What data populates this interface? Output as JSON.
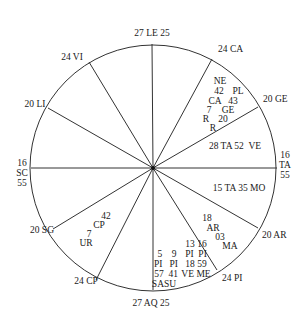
{
  "chart": {
    "center": {
      "x": 153,
      "y": 168
    },
    "radius": 123,
    "line_color": "#333333",
    "cusps": [
      {
        "label": "27 LE 25",
        "x2": 152,
        "y2": 44,
        "lx": 152,
        "ly": 36,
        "anchor": "middle"
      },
      {
        "label": "24 CA",
        "x2": 212,
        "y2": 59,
        "lx": 218,
        "ly": 52,
        "anchor": "start"
      },
      {
        "label": "20 GE",
        "x2": 258,
        "y2": 107,
        "lx": 263,
        "ly": 102,
        "anchor": "start"
      },
      {
        "label": "16",
        "x2": 277,
        "y2": 168,
        "lx": 285,
        "ly": 158,
        "anchor": "middle"
      },
      {
        "label": "20 AR",
        "x2": 258,
        "y2": 228,
        "lx": 262,
        "ly": 238,
        "anchor": "start"
      },
      {
        "label": "24 PI",
        "x2": 217,
        "y2": 270,
        "lx": 222,
        "ly": 281,
        "anchor": "start"
      },
      {
        "label": "27 AQ 25",
        "x2": 153,
        "y2": 290,
        "lx": 151,
        "ly": 306,
        "anchor": "middle"
      },
      {
        "label": "24 CP",
        "x2": 96,
        "y2": 280,
        "lx": 86,
        "ly": 284,
        "anchor": "middle"
      },
      {
        "label": "20 SG",
        "x2": 53,
        "y2": 229,
        "lx": 42,
        "ly": 233,
        "anchor": "middle"
      },
      {
        "label": "16",
        "x2": 31,
        "y2": 168,
        "lx": 22,
        "ly": 166,
        "anchor": "middle"
      },
      {
        "label": "20 LI",
        "x2": 48,
        "y2": 108,
        "lx": 35,
        "ly": 107,
        "anchor": "middle"
      },
      {
        "label": "24 VI",
        "x2": 89,
        "y2": 62,
        "lx": 72,
        "ly": 60,
        "anchor": "middle"
      }
    ],
    "cusp_extra": {
      "east": [
        "TA",
        "55"
      ],
      "west": [
        "SC",
        "55"
      ]
    },
    "planets": [
      {
        "text": "NE",
        "x": 220,
        "y": 84
      },
      {
        "text": "42",
        "x": 219,
        "y": 94
      },
      {
        "text": "PL",
        "x": 238,
        "y": 94
      },
      {
        "text": "CA",
        "x": 215,
        "y": 104
      },
      {
        "text": "43",
        "x": 233,
        "y": 104
      },
      {
        "text": "7",
        "x": 209,
        "y": 113
      },
      {
        "text": "GE",
        "x": 228,
        "y": 113
      },
      {
        "text": "R",
        "x": 206,
        "y": 122
      },
      {
        "text": "20",
        "x": 223,
        "y": 122
      },
      {
        "text": "R",
        "x": 213,
        "y": 131
      },
      {
        "text": "28 TA 52  VE",
        "x": 235,
        "y": 149
      },
      {
        "text": "15 TA 35 MO",
        "x": 239,
        "y": 191
      },
      {
        "text": "18",
        "x": 207,
        "y": 221
      },
      {
        "text": "AR",
        "x": 213,
        "y": 231
      },
      {
        "text": "03",
        "x": 220,
        "y": 240
      },
      {
        "text": "MA",
        "x": 230,
        "y": 249
      },
      {
        "text": "13 16",
        "x": 196,
        "y": 247
      },
      {
        "text": "PI  PI",
        "x": 196,
        "y": 257
      },
      {
        "text": "18 59",
        "x": 196,
        "y": 267
      },
      {
        "text": "VE ME",
        "x": 196,
        "y": 277
      },
      {
        "text": "5    9",
        "x": 167,
        "y": 257
      },
      {
        "text": "PI   PI",
        "x": 166,
        "y": 267
      },
      {
        "text": "57  41",
        "x": 166,
        "y": 277
      },
      {
        "text": "SASU",
        "x": 164,
        "y": 287
      },
      {
        "text": "42",
        "x": 106,
        "y": 219
      },
      {
        "text": "CP",
        "x": 99,
        "y": 228
      },
      {
        "text": "7",
        "x": 89,
        "y": 237
      },
      {
        "text": "UR",
        "x": 86,
        "y": 246
      }
    ]
  }
}
